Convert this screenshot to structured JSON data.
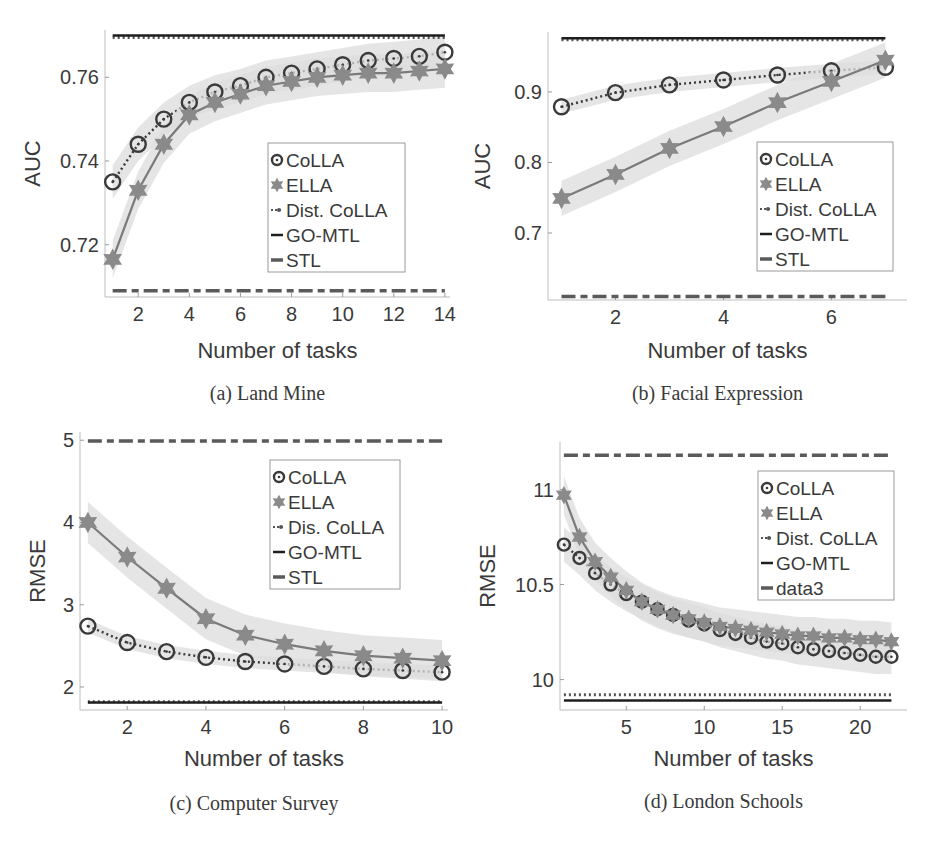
{
  "chart_data": [
    {
      "id": "a",
      "type": "line",
      "caption": "(a) Land Mine",
      "xlabel": "Number of tasks",
      "ylabel": "AUC",
      "xlim": [
        0.7,
        14.2
      ],
      "ylim": [
        0.7075,
        0.7713
      ],
      "xticks": [
        2,
        4,
        6,
        8,
        10,
        12,
        14
      ],
      "yticks": [
        0.72,
        0.74,
        0.76
      ],
      "ytick_labels": [
        "0.72",
        "0.74",
        "0.76"
      ],
      "x": [
        1,
        2,
        3,
        4,
        5,
        6,
        7,
        8,
        9,
        10,
        11,
        12,
        13,
        14
      ],
      "legend": [
        "CoLLA",
        "ELLA",
        "Dist. CoLLA",
        "GO-MTL",
        "STL"
      ],
      "legend_position": "center-right",
      "series": [
        {
          "name": "CoLLA",
          "style": "circle-dotted",
          "values": [
            0.735,
            0.744,
            0.75,
            0.754,
            0.7565,
            0.758,
            0.76,
            0.761,
            0.762,
            0.763,
            0.764,
            0.7645,
            0.765,
            0.766
          ],
          "band": 0.004
        },
        {
          "name": "ELLA",
          "style": "star-solid",
          "values": [
            0.7165,
            0.733,
            0.744,
            0.751,
            0.754,
            0.756,
            0.758,
            0.759,
            0.76,
            0.7605,
            0.761,
            0.761,
            0.7615,
            0.762
          ],
          "band": 0.0045
        },
        {
          "name": "Dist. CoLLA",
          "style": "dot-dotted",
          "constant": 0.7695
        },
        {
          "name": "GO-MTL",
          "style": "solid-black",
          "constant": 0.77
        },
        {
          "name": "STL",
          "style": "dashed",
          "constant": 0.709
        }
      ]
    },
    {
      "id": "b",
      "type": "line",
      "caption": "(b) Facial Expression",
      "xlabel": "Number of tasks",
      "ylabel": "AUC",
      "xlim": [
        0.75,
        7.4
      ],
      "ylim": [
        0.605,
        0.985
      ],
      "xticks": [
        2,
        4,
        6
      ],
      "yticks": [
        0.7,
        0.8,
        0.9
      ],
      "ytick_labels": [
        "0.7",
        "0.8",
        "0.9"
      ],
      "x": [
        1,
        2,
        3,
        4,
        5,
        6,
        7
      ],
      "legend": [
        "CoLLA",
        "ELLA",
        "Dist. CoLLA",
        "GO-MTL",
        "STL"
      ],
      "legend_position": "center-right",
      "series": [
        {
          "name": "CoLLA",
          "style": "circle-dotted",
          "values": [
            0.879,
            0.899,
            0.91,
            0.917,
            0.924,
            0.93,
            0.935
          ],
          "band": 0.01
        },
        {
          "name": "ELLA",
          "style": "star-solid",
          "values": [
            0.749,
            0.783,
            0.82,
            0.851,
            0.885,
            0.915,
            0.945
          ],
          "band": 0.025
        },
        {
          "name": "Dist. CoLLA",
          "style": "dot-dotted",
          "constant": 0.974
        },
        {
          "name": "GO-MTL",
          "style": "solid-black",
          "constant": 0.976
        },
        {
          "name": "STL",
          "style": "dashed",
          "constant": 0.61
        }
      ]
    },
    {
      "id": "c",
      "type": "line",
      "caption": "(c) Computer Survey",
      "xlabel": "Number of tasks",
      "ylabel": "RMSE",
      "xlim": [
        0.8,
        10.15
      ],
      "ylim": [
        1.72,
        5.1
      ],
      "xticks": [
        2,
        4,
        6,
        8,
        10
      ],
      "yticks": [
        2,
        3,
        4,
        5
      ],
      "ytick_labels": [
        "2",
        "3",
        "4",
        "5"
      ],
      "x": [
        1,
        2,
        3,
        4,
        5,
        6,
        7,
        8,
        9,
        10
      ],
      "legend": [
        "CoLLA",
        "ELLA",
        "Dis. CoLLA",
        "GO-MTL",
        "STL"
      ],
      "legend_position": "upper-right",
      "series": [
        {
          "name": "CoLLA",
          "style": "circle-dotted",
          "values": [
            2.74,
            2.54,
            2.43,
            2.36,
            2.31,
            2.28,
            2.25,
            2.22,
            2.2,
            2.18
          ],
          "band": 0.08
        },
        {
          "name": "ELLA",
          "style": "star-solid",
          "values": [
            4.0,
            3.58,
            3.2,
            2.83,
            2.63,
            2.52,
            2.44,
            2.38,
            2.35,
            2.32
          ],
          "band": 0.25
        },
        {
          "name": "Dis. CoLLA",
          "style": "dot-dotted",
          "constant": 1.82
        },
        {
          "name": "GO-MTL",
          "style": "solid-black",
          "constant": 1.81
        },
        {
          "name": "STL",
          "style": "dashed",
          "constant": 4.99
        }
      ]
    },
    {
      "id": "d",
      "type": "line",
      "caption": "(d) London Schools",
      "xlabel": "Number of tasks",
      "ylabel": "RMSE",
      "xlim": [
        0.75,
        23.0
      ],
      "ylim": [
        9.84,
        11.25
      ],
      "xticks": [
        5,
        10,
        15,
        20
      ],
      "yticks": [
        10,
        10.5,
        11
      ],
      "ytick_labels": [
        "10",
        "10.5",
        "11"
      ],
      "x": [
        1,
        2,
        3,
        4,
        5,
        6,
        7,
        8,
        9,
        10,
        11,
        12,
        13,
        14,
        15,
        16,
        17,
        18,
        19,
        20,
        21,
        22
      ],
      "legend": [
        "CoLLA",
        "ELLA",
        "Dist. CoLLA",
        "GO-MTL",
        "data3"
      ],
      "legend_position": "upper-right",
      "series": [
        {
          "name": "CoLLA",
          "style": "circle-dotted",
          "values": [
            10.71,
            10.64,
            10.56,
            10.5,
            10.45,
            10.41,
            10.37,
            10.34,
            10.31,
            10.29,
            10.26,
            10.24,
            10.22,
            10.2,
            10.19,
            10.17,
            10.16,
            10.15,
            10.14,
            10.13,
            10.12,
            10.12
          ],
          "band": 0.09
        },
        {
          "name": "ELLA",
          "style": "star-solid",
          "values": [
            10.97,
            10.75,
            10.62,
            10.54,
            10.47,
            10.41,
            10.37,
            10.34,
            10.32,
            10.3,
            10.28,
            10.27,
            10.26,
            10.25,
            10.24,
            10.23,
            10.23,
            10.22,
            10.22,
            10.21,
            10.21,
            10.2
          ],
          "band": 0.1
        },
        {
          "name": "Dist. CoLLA",
          "style": "dot-dotted",
          "constant": 9.92
        },
        {
          "name": "GO-MTL",
          "style": "solid-black",
          "constant": 9.89
        },
        {
          "name": "data3",
          "style": "dashed",
          "constant": 11.18
        }
      ]
    }
  ]
}
